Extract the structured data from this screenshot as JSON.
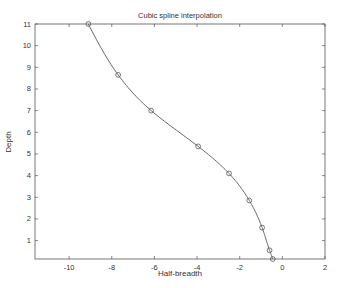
{
  "chart_data": {
    "type": "line",
    "title": "Cubic spline interpolation",
    "xlabel": "Half-breadth",
    "ylabel": "Depth",
    "xlim": [
      -11.6,
      2
    ],
    "ylim": [
      0.15,
      11
    ],
    "xticks": [
      -10,
      -8,
      -6,
      -4,
      -2,
      0,
      2
    ],
    "yticks": [
      1,
      2,
      3,
      4,
      5,
      6,
      7,
      8,
      9,
      10,
      11
    ],
    "grid": false,
    "legend": null,
    "series": [
      {
        "name": "data points",
        "marker": "circle",
        "line": "none",
        "x": [
          -9.1,
          -7.7,
          -6.15,
          -3.95,
          -2.5,
          -1.55,
          -0.95,
          -0.6,
          -0.45
        ],
        "y": [
          11.0,
          8.65,
          7.0,
          5.35,
          4.1,
          2.85,
          1.6,
          0.55,
          0.15
        ]
      },
      {
        "name": "cubic spline",
        "marker": "none",
        "line": "solid",
        "x": [
          -9.1,
          -7.7,
          -6.15,
          -3.95,
          -2.5,
          -1.55,
          -0.95,
          -0.6,
          -0.45
        ],
        "y": [
          11.0,
          8.65,
          7.0,
          5.35,
          4.1,
          2.85,
          1.6,
          0.55,
          0.15
        ]
      }
    ],
    "colors": {
      "line": "#555555",
      "axes": "#555555",
      "marker": "#555555"
    }
  }
}
